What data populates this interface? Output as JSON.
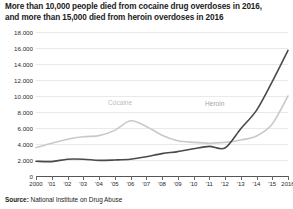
{
  "title": {
    "line1": "More than 10,000 people died from cocaine drug overdoses in 2016,",
    "line2": "and more than 15,000 died from heroin overdoses in 2016"
  },
  "source": {
    "prefix": "Source:",
    "text": " National Institute on Drug Abuse"
  },
  "colors": {
    "cocaine": "#c9c9c9",
    "heroin": "#4a4a4a",
    "grid": "#e9e9e9",
    "axis": "#555555",
    "text": "#1b1b1b"
  },
  "chart_data": {
    "type": "line",
    "title": "More than 10,000 people died from cocaine drug overdoses in 2016, and more than 15,000 died from heroin overdoses in 2016",
    "xlabel": "",
    "ylabel": "",
    "ylim": [
      0,
      18000
    ],
    "ytick_step": 2000,
    "grid": true,
    "legend": "inline-labels",
    "ytick_labels": [
      "0",
      "2.000",
      "4.000",
      "6.000",
      "8.000",
      "10.000",
      "12.000",
      "14.000",
      "16.000",
      "18.000"
    ],
    "ytick_values": [
      0,
      2000,
      4000,
      6000,
      8000,
      10000,
      12000,
      14000,
      16000,
      18000
    ],
    "x": [
      2000,
      2001,
      2002,
      2003,
      2004,
      2005,
      2006,
      2007,
      2008,
      2009,
      2010,
      2011,
      2012,
      2013,
      2014,
      2015,
      2016
    ],
    "xtick_labels": [
      "2000",
      "'01",
      "'02",
      "'03",
      "'04",
      "'05",
      "'06",
      "'07",
      "'08",
      "'09",
      "'10",
      "'11",
      "'12",
      "'13",
      "'14",
      "'15",
      "2016"
    ],
    "series": [
      {
        "name": "Cocaine",
        "color": "#c9c9c9",
        "values": [
          3540,
          4100,
          4600,
          4900,
          5050,
          5700,
          6900,
          6200,
          5100,
          4400,
          4200,
          4100,
          4200,
          4500,
          5000,
          6500,
          10000
        ]
      },
      {
        "name": "Heroin",
        "color": "#4a4a4a",
        "values": [
          1850,
          1800,
          2100,
          2100,
          1950,
          2000,
          2100,
          2400,
          2800,
          3050,
          3400,
          3700,
          3500,
          5900,
          8200,
          11800,
          15700
        ]
      }
    ]
  }
}
